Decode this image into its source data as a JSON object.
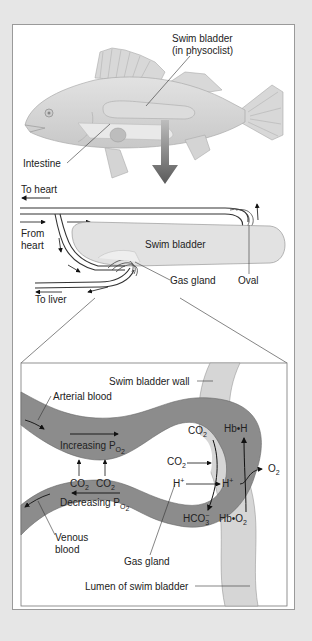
{
  "figure": {
    "colors": {
      "background": "#e6e6e6",
      "panel": "#ffffff",
      "blood_vessel": "#8c8c8c",
      "swim_bladder_wall": "#d6d6d6",
      "fish_body": "#d0d0d0",
      "arrow_big": "#6a6a6a",
      "text": "#222222"
    },
    "fish_panel": {
      "labels": {
        "swim_bladder_line1": "Swim bladder",
        "swim_bladder_line2": "(in physoclist)",
        "intestine": "Intestine"
      }
    },
    "rete_panel": {
      "labels": {
        "to_heart": "To heart",
        "from_heart_line1": "From",
        "from_heart_line2": "heart",
        "swim_bladder": "Swim bladder",
        "gas_gland": "Gas gland",
        "oval": "Oval",
        "to_liver": "To liver"
      }
    },
    "detail_panel": {
      "labels": {
        "swim_bladder_wall": "Swim bladder wall",
        "arterial_blood": "Arterial blood",
        "increasing_po2": "Increasing P",
        "decreasing_po2": "Decreasing P",
        "po2_sub": "O",
        "po2_subsub": "2",
        "co2_left_a": "CO",
        "co2_left_b": "CO",
        "sub2": "2",
        "venous_line1": "Venous",
        "venous_line2": "blood",
        "gas_gland": "Gas gland",
        "co2_top": "CO",
        "co2_mid": "CO",
        "h_plus_in": "H",
        "h_plus_out": "H",
        "plus": "+",
        "hco3": "HCO",
        "hco3_sub": "3",
        "hco3_sup": "−",
        "hb_h": "Hb•H",
        "hb_o2": "Hb•O",
        "o2": "O",
        "lumen": "Lumen of swim bladder"
      }
    }
  }
}
